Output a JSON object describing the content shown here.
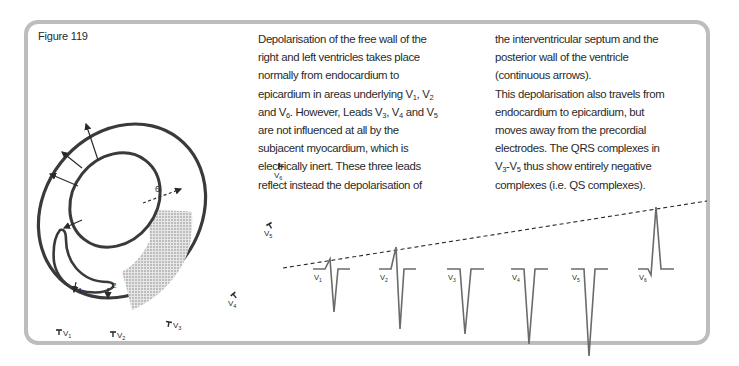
{
  "figure": {
    "label": "Figure 119"
  },
  "text": {
    "column_1": [
      {
        "parts": [
          {
            "t": "Depolarisation of the free wall of the"
          }
        ]
      },
      {
        "parts": [
          {
            "t": "right and left ventricles takes place"
          }
        ]
      },
      {
        "parts": [
          {
            "t": "normally from endocardium to"
          }
        ]
      },
      {
        "parts": [
          {
            "t": "epicardium in areas underlying V"
          },
          {
            "sub": "1"
          },
          {
            "t": ", V"
          },
          {
            "sub": "2"
          }
        ]
      },
      {
        "parts": [
          {
            "t": "and V"
          },
          {
            "sub": "6"
          },
          {
            "t": ". However, Leads V"
          },
          {
            "sub": "3"
          },
          {
            "t": ", V"
          },
          {
            "sub": "4"
          },
          {
            "t": " and V"
          },
          {
            "sub": "5"
          }
        ]
      },
      {
        "parts": [
          {
            "t": "are not influenced at all by the"
          }
        ]
      },
      {
        "parts": [
          {
            "t": "subjacent myocardium, which is"
          }
        ]
      },
      {
        "parts": [
          {
            "t": "electrically inert. These three leads"
          }
        ]
      },
      {
        "parts": [
          {
            "t": "reflect instead the depolarisation of"
          }
        ]
      }
    ],
    "column_2": [
      {
        "parts": [
          {
            "t": "the interventricular septum and the"
          }
        ]
      },
      {
        "parts": [
          {
            "t": "posterior wall of the ventricle"
          }
        ]
      },
      {
        "parts": [
          {
            "t": "(continuous arrows)."
          }
        ]
      },
      {
        "parts": [
          {
            "t": "This depolarisation also travels from"
          }
        ]
      },
      {
        "parts": [
          {
            "t": "endocardium to epicardium, but"
          }
        ]
      },
      {
        "parts": [
          {
            "t": "moves away from the precordial"
          }
        ]
      },
      {
        "parts": [
          {
            "t": "electrodes. The QRS complexes in"
          }
        ]
      },
      {
        "parts": [
          {
            "t": "V"
          },
          {
            "sub": "3"
          },
          {
            "t": "-V"
          },
          {
            "sub": "5"
          },
          {
            "t": " thus show entirely negative"
          }
        ]
      },
      {
        "parts": [
          {
            "t": "complexes (i.e. QS complexes)."
          }
        ]
      }
    ]
  },
  "heart_diagram": {
    "arrow_labels": {
      "dashed": "6",
      "septal_1": "1",
      "septal_2": "2"
    },
    "shaded_region": "electrically inert myocardium",
    "electrodes": [
      {
        "lead": "V",
        "sub": "1",
        "x": 63,
        "y": 334
      },
      {
        "lead": "V",
        "sub": "2",
        "x": 117,
        "y": 336
      },
      {
        "lead": "V",
        "sub": "3",
        "x": 173,
        "y": 326
      },
      {
        "lead": "V",
        "sub": "4",
        "x": 237,
        "y": 402
      },
      {
        "lead": "V",
        "sub": "5",
        "x": 273,
        "y": 237
      },
      {
        "lead": "V",
        "sub": "6",
        "x": 283,
        "y": 183
      }
    ]
  },
  "ecg_traces": {
    "baseline_y": 269,
    "color": "#6b6b6b",
    "leads": [
      {
        "lead": "V",
        "sub": "1",
        "x": 330,
        "r": 10,
        "s": 43
      },
      {
        "lead": "V",
        "sub": "2",
        "x": 396,
        "r": 22,
        "s": 60
      },
      {
        "lead": "V",
        "sub": "3",
        "x": 464,
        "r": 0,
        "s": 65
      },
      {
        "lead": "V",
        "sub": "4",
        "x": 528,
        "r": 0,
        "s": 75
      },
      {
        "lead": "V",
        "sub": "5",
        "x": 588,
        "r": 0,
        "s": 87
      },
      {
        "lead": "V",
        "sub": "6",
        "x": 655,
        "r": 62,
        "s": 6
      }
    ],
    "r_wave_trend_line": {
      "x1": 283,
      "y1": 268,
      "x2": 707,
      "y2": 201
    }
  }
}
